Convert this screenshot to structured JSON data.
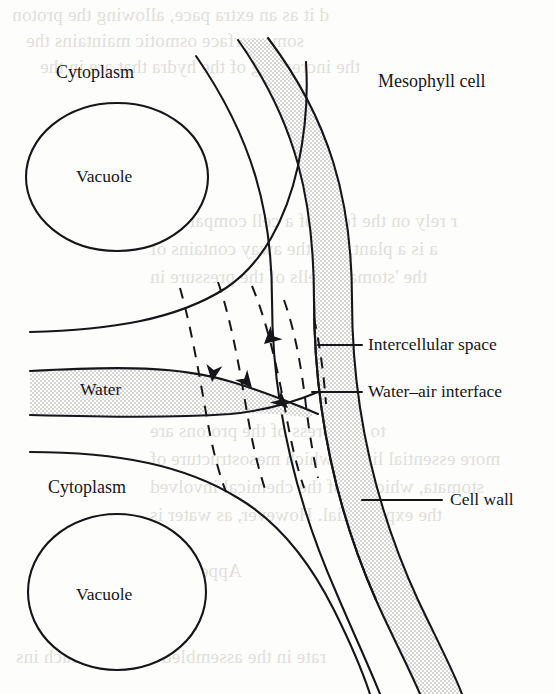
{
  "figure": {
    "kind": "biology-diagram",
    "background_color": "#fdfdfb",
    "ink_color": "#16161a",
    "stipple_color": "#e8e8e6"
  },
  "labels": {
    "cytoplasm_top": "Cytoplasm",
    "vacuole_top": "Vacuole",
    "mesophyll_cell": "Mesophyll cell",
    "water": "Water",
    "intercellular_space": "Intercellular space",
    "water_air_interface": "Water–air interface",
    "cytoplasm_bottom": "Cytoplasm",
    "vacuole_bottom": "Vacuole",
    "cell_wall": "Cell wall"
  },
  "ghost_text": {
    "line1": "d it as an extra pace, allowing the proton",
    "line2": "some surface osmotic maintains the",
    "line3": "the increasing of the hydra that are in the",
    "line4": "r rely on the form of a cell compared to",
    "line5": "a is a plant, and the away contains of",
    "line6": "the 'stomata' cells of the pressure in",
    "line7": "to compress of the protons are",
    "line8": "more essential living which mesostructure of",
    "line9": "stomata, which is of the chemical involved",
    "line10": "the exponential. However, as water is",
    "line11": "Appendices",
    "line12": "rate in the assembled energy in each ins"
  },
  "regions": {
    "vacuole_top_label_pos": [
      117,
      183
    ],
    "vacuole_bottom_label_pos": [
      117,
      596
    ],
    "water_band": "stippled horizontal band narrowing toward the cell wall",
    "cell_wall_band": "stippled arc band on the right side of the figure"
  },
  "arrows": {
    "count": 4,
    "meaning": "water flow toward the water-air interface",
    "directions": [
      "down-right",
      "down",
      "up-right",
      "up-right"
    ]
  },
  "dashed_lines": {
    "count": 5,
    "meaning": "lines of equal water potential (isobars) crossing the wall"
  },
  "leader_lines": [
    {
      "for": "intercellular_space",
      "from": [
        322,
        345
      ],
      "to": [
        362,
        345
      ]
    },
    {
      "for": "water_air_interface",
      "from": [
        312,
        392
      ],
      "to": [
        362,
        392
      ]
    },
    {
      "for": "cell_wall",
      "from": [
        365,
        500
      ],
      "to": [
        440,
        500
      ]
    }
  ]
}
